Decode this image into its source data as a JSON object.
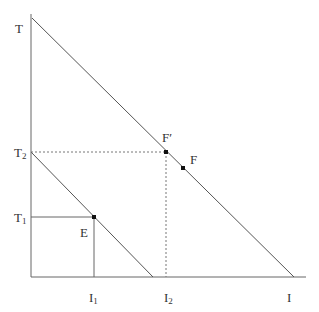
{
  "diagram": {
    "type": "budget-constraint",
    "axes": {
      "y_label": "T",
      "x_label": "I"
    },
    "labels": {
      "T": "T",
      "T2_base": "T",
      "T2_sub": "2",
      "T1_base": "T",
      "T1_sub": "1",
      "I1_base": "I",
      "I1_sub": "1",
      "I2_base": "I",
      "I2_sub": "2",
      "I": "I",
      "E": "E",
      "F_prime": "F′",
      "F": "F"
    },
    "points": {
      "E": {
        "x": 94,
        "y": 217
      },
      "F_prime": {
        "x": 166,
        "y": 152
      },
      "F": {
        "x": 183,
        "y": 168
      }
    },
    "lines": {
      "outer_budget": {
        "from": "T",
        "to": "I"
      },
      "inner_budget": {
        "from": "T2",
        "to": "x-intercept"
      }
    },
    "colors": {
      "line": "#555555",
      "dashed": "#777777",
      "point": "#111111"
    }
  }
}
